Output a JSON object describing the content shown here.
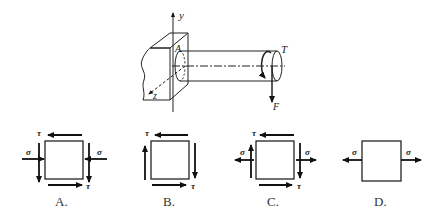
{
  "figure": {
    "labels": {
      "y_axis": "y",
      "z_axis": "z",
      "point": "A",
      "torque": "T",
      "force": "F"
    }
  },
  "options": [
    {
      "letter": "A.",
      "tau_top": "τ",
      "tau_bottom": "τ",
      "sigma_left": "σ",
      "sigma_right": "σ",
      "sigma_direction": "compressive"
    },
    {
      "letter": "B.",
      "tau_top": "τ",
      "tau_bottom": "τ",
      "sigma_direction": "none"
    },
    {
      "letter": "C.",
      "tau_top": "τ",
      "tau_bottom": "τ",
      "sigma_left": "σ",
      "sigma_right": "σ",
      "sigma_direction": "tensile"
    },
    {
      "letter": "D.",
      "sigma_left": "σ",
      "sigma_right": "σ",
      "sigma_direction": "tensile"
    }
  ]
}
